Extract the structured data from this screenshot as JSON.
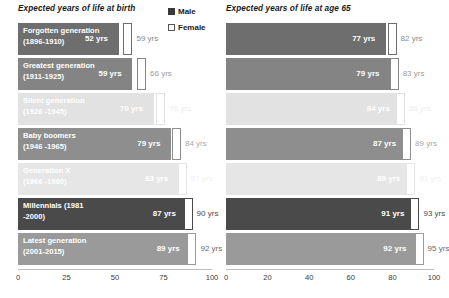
{
  "legend": {
    "items": [
      {
        "label": "Male",
        "swatch": "male",
        "color": "#3a3a3a"
      },
      {
        "label": "Female",
        "swatch": "female",
        "color": "#ffffff"
      }
    ]
  },
  "charts": [
    {
      "id": "birth",
      "title": "Expected years of life at birth",
      "axis": {
        "min": 0,
        "max": 100,
        "ticks": [
          "0",
          "25",
          "50",
          "75",
          "100"
        ],
        "tick_values": [
          0,
          25,
          50,
          75,
          100
        ]
      },
      "show_labels": true
    },
    {
      "id": "age65",
      "title": "Expected years of life at age 65",
      "axis": {
        "min": 0,
        "max": 100,
        "ticks": [
          "0",
          "20",
          "40",
          "60",
          "80",
          "100"
        ],
        "tick_values": [
          0,
          20,
          40,
          60,
          80,
          100
        ]
      },
      "show_labels": false
    }
  ],
  "chart_data": [
    {
      "type": "bar",
      "orientation": "horizontal",
      "title": "Expected years of life at birth",
      "xlabel": "",
      "ylabel": "",
      "xlim": [
        0,
        100
      ],
      "ticks": [
        0,
        25,
        50,
        75,
        100
      ],
      "grid": false,
      "legend": [
        "Male",
        "Female"
      ],
      "legend_position": "top-right",
      "categories": [
        "Forgotten generation (1896-1910)",
        "Greatest generation (1911-1925)",
        "Silent generation (1926 -1945)",
        "Baby boomers (1946 -1965)",
        "Generation X (1966 -1980)",
        "Millennials (1981 -2000)",
        "Latest generation (2001-2015)"
      ],
      "series": [
        {
          "name": "Male",
          "values": [
            52,
            59,
            70,
            79,
            83,
            87,
            89
          ]
        },
        {
          "name": "Female",
          "values": [
            59,
            66,
            76,
            84,
            87,
            90,
            92
          ]
        }
      ]
    },
    {
      "type": "bar",
      "orientation": "horizontal",
      "title": "Expected years of life at age 65",
      "xlabel": "",
      "ylabel": "",
      "xlim": [
        0,
        100
      ],
      "ticks": [
        0,
        20,
        40,
        60,
        80,
        100
      ],
      "grid": false,
      "legend": [
        "Male",
        "Female"
      ],
      "legend_position": "shared-left-panel",
      "categories": [
        "Forgotten generation (1896-1910)",
        "Greatest generation (1911-1925)",
        "Silent generation (1926 -1945)",
        "Baby boomers (1946 -1965)",
        "Generation X (1966 -1980)",
        "Millennials (1981 -2000)",
        "Latest generation (2001-2015)"
      ],
      "series": [
        {
          "name": "Male",
          "values": [
            77,
            79,
            84,
            87,
            89,
            91,
            92
          ]
        },
        {
          "name": "Female",
          "values": [
            82,
            83,
            86,
            89,
            91,
            93,
            95
          ]
        }
      ]
    }
  ],
  "rows": [
    {
      "label": "Forgotten generation\n(1896-1910)",
      "bar_color": "#6e6e6e",
      "female_text_color": "#8a8a8a",
      "female_border": "#6e6e6e",
      "birth": {
        "male": "52 yrs",
        "female": "59 yrs",
        "male_value": 52,
        "female_value": 59
      },
      "age65": {
        "male": "77 yrs",
        "female": "82 yrs",
        "male_value": 77,
        "female_value": 82
      }
    },
    {
      "label": "Greatest generation\n(1911-1925)",
      "bar_color": "#848484",
      "female_text_color": "#9b9b9b",
      "female_border": "#848484",
      "birth": {
        "male": "59 yrs",
        "female": "66 yrs",
        "male_value": 59,
        "female_value": 66
      },
      "age65": {
        "male": "79 yrs",
        "female": "83 yrs",
        "male_value": 79,
        "female_value": 83
      }
    },
    {
      "label": "Silent generation\n(1926 -1945)",
      "bar_color": "#e2e2e2",
      "female_text_color": "#ececec",
      "female_border": "#e2e2e2",
      "birth": {
        "male": "70 yrs",
        "female": "76 yrs",
        "male_value": 70,
        "female_value": 76
      },
      "age65": {
        "male": "84 yrs",
        "female": "86 yrs",
        "male_value": 84,
        "female_value": 86
      }
    },
    {
      "label": "Baby boomers\n(1946 -1965)",
      "bar_color": "#8e8e8e",
      "female_text_color": "#a8a8a8",
      "female_border": "#8e8e8e",
      "birth": {
        "male": "79 yrs",
        "female": "84 yrs",
        "male_value": 79,
        "female_value": 84
      },
      "age65": {
        "male": "87 yrs",
        "female": "89 yrs",
        "male_value": 87,
        "female_value": 89
      }
    },
    {
      "label": "Generation X\n(1966 -1980)",
      "bar_color": "#e6e6e6",
      "female_text_color": "#efefef",
      "female_border": "#e6e6e6",
      "birth": {
        "male": "83 yrs",
        "female": "87 yrs",
        "male_value": 83,
        "female_value": 87
      },
      "age65": {
        "male": "89 yrs",
        "female": "91 yrs",
        "male_value": 89,
        "female_value": 91
      }
    },
    {
      "label": "Millennials (1981\n-2000)",
      "bar_color": "#4a4a4a",
      "female_text_color": "#4a4a4a",
      "female_border": "#4a4a4a",
      "birth": {
        "male": "87 yrs",
        "female": "90 yrs",
        "male_value": 87,
        "female_value": 90
      },
      "age65": {
        "male": "91 yrs",
        "female": "93 yrs",
        "male_value": 91,
        "female_value": 93
      }
    },
    {
      "label": "Latest generation\n(2001-2015)",
      "bar_color": "#9a9a9a",
      "female_text_color": "#6a6a6a",
      "female_border": "#9a9a9a",
      "birth": {
        "male": "89 yrs",
        "female": "92 yrs",
        "male_value": 89,
        "female_value": 92
      },
      "age65": {
        "male": "92 yrs",
        "female": "95 yrs",
        "male_value": 92,
        "female_value": 95
      }
    }
  ]
}
